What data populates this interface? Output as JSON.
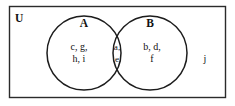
{
  "diagram": {
    "type": "venn",
    "universe": {
      "label": "U"
    },
    "sets": [
      {
        "label": "A",
        "label_x": 84,
        "label_y": 24,
        "cx": 84,
        "cy": 53,
        "r": 37
      },
      {
        "label": "B",
        "label_x": 150,
        "label_y": 24,
        "cx": 150,
        "cy": 53,
        "r": 37
      }
    ],
    "regions": {
      "a_only": {
        "line1": "c, g,",
        "line2": "h, i"
      },
      "intersection": {
        "line1": "a,",
        "line2": "e"
      },
      "b_only": {
        "line1": "b, d,",
        "line2": "f"
      },
      "outside": {
        "line1": "j"
      }
    },
    "colors": {
      "border": "#2b2b2b",
      "circle_stroke": "#1c1c1c",
      "text": "#111111",
      "background": "#ffffff"
    }
  }
}
